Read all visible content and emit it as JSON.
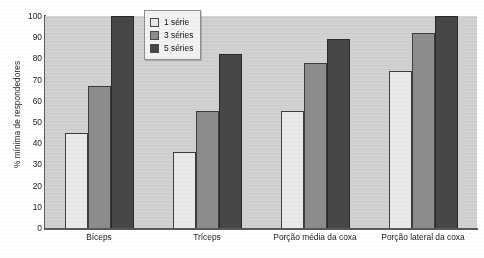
{
  "chart_data": {
    "type": "bar",
    "title": "",
    "subtitle": "",
    "xlabel": "",
    "ylabel": "% mínima de respondedores",
    "ylim": [
      0,
      100
    ],
    "yticks": [
      100,
      90,
      80,
      70,
      60,
      50,
      40,
      30,
      20,
      10,
      0
    ],
    "grid": false,
    "legend_position": "top-center",
    "categories": [
      "Bíceps",
      "Tríceps",
      "Porção média da coxa",
      "Porção lateral da coxa"
    ],
    "series": [
      {
        "name": "1 série",
        "color": "#e9e9e9",
        "values": [
          45,
          36,
          55,
          74
        ]
      },
      {
        "name": "3 séries",
        "color": "#8d8d8d",
        "values": [
          67,
          55,
          78,
          92
        ]
      },
      {
        "name": "5 séries",
        "color": "#474747",
        "values": [
          100,
          82,
          89,
          100
        ]
      }
    ]
  },
  "colors": {
    "plot_background": "#d3d3d3",
    "page_background": "#ffffff",
    "axis": "#5a5a5a",
    "bar_outline": "#3d3d3d",
    "text": "#1c1c1c",
    "legend_background": "#f2f2f2",
    "legend_border": "#8e8e8e"
  }
}
